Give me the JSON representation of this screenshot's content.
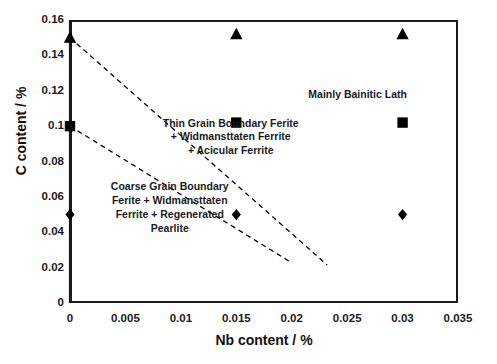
{
  "chart_data": {
    "type": "scatter",
    "title": "",
    "xlabel": "Nb content / %",
    "ylabel": "C content / %",
    "xlim": [
      0,
      0.035
    ],
    "ylim": [
      0,
      0.16
    ],
    "xticks": [
      "0",
      "0.005",
      "0.01",
      "0.015",
      "0.02",
      "0.025",
      "0.03",
      "0.035"
    ],
    "xtick_values": [
      0,
      0.005,
      0.01,
      0.015,
      0.02,
      0.025,
      0.03,
      0.035
    ],
    "yticks": [
      "0",
      "0.02",
      "0.04",
      "0.06",
      "0.08",
      "0.1",
      "0.12",
      "0.14",
      "0.16"
    ],
    "ytick_values": [
      0,
      0.02,
      0.04,
      0.06,
      0.08,
      0.1,
      0.12,
      0.14,
      0.16
    ],
    "grid": false,
    "legend": "none",
    "series": [
      {
        "name": "triangle-series",
        "marker": "triangle",
        "color": "#000000",
        "points": [
          {
            "x": 0,
            "y": 0.15
          },
          {
            "x": 0.015,
            "y": 0.152
          },
          {
            "x": 0.03,
            "y": 0.152
          }
        ]
      },
      {
        "name": "square-series",
        "marker": "square",
        "color": "#000000",
        "points": [
          {
            "x": 0,
            "y": 0.1
          },
          {
            "x": 0.015,
            "y": 0.102
          },
          {
            "x": 0.03,
            "y": 0.102
          }
        ]
      },
      {
        "name": "diamond-series",
        "marker": "diamond",
        "color": "#000000",
        "points": [
          {
            "x": 0,
            "y": 0.05
          },
          {
            "x": 0.015,
            "y": 0.05
          },
          {
            "x": 0.03,
            "y": 0.05
          }
        ]
      }
    ],
    "boundary_lines": [
      {
        "name": "upper-boundary-line",
        "style": "dashed",
        "color": "#000000",
        "from": {
          "x": 0,
          "y": 0.15
        },
        "to": {
          "x": 0.0232,
          "y": 0.0215
        }
      },
      {
        "name": "lower-boundary-line",
        "style": "dashed",
        "color": "#000000",
        "from": {
          "x": 0,
          "y": 0.1
        },
        "to": {
          "x": 0.0198,
          "y": 0.0235
        }
      }
    ],
    "annotations": [
      {
        "name": "mainly-bainitic-lath",
        "lines": [
          "Mainly Bainitic Lath"
        ],
        "x": 0.0215,
        "y": 0.1175
      },
      {
        "name": "thin-grain-boundary-region",
        "lines": [
          "Thin Grain Boundary Ferite",
          "+ Widmansttaten Ferrite",
          "+ Acicular Ferrite"
        ],
        "x": 0.0145,
        "y": 0.0935
      },
      {
        "name": "coarse-grain-boundary-region",
        "lines": [
          "Coarse Grain Boundary",
          "Ferite + Widmansttaten",
          "Ferrite + Regenerated",
          "Pearlite"
        ],
        "x": 0.009,
        "y": 0.0535
      }
    ]
  },
  "axes": {
    "x_title": "Nb content / %",
    "y_title": "C content / %"
  },
  "caption": {
    "remnant": ""
  }
}
